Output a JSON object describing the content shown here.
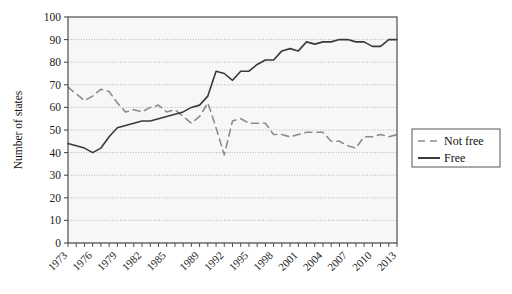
{
  "chart_data": {
    "type": "line",
    "title": "",
    "xlabel": "",
    "ylabel": "Number of states",
    "ylim": [
      0,
      100
    ],
    "xlim": [
      1973,
      2013
    ],
    "ytick_step": 10,
    "yticks": [
      0,
      10,
      20,
      30,
      40,
      50,
      60,
      70,
      80,
      90,
      100
    ],
    "xticks": [
      1973,
      1976,
      1979,
      1982,
      1985,
      1989,
      1992,
      1995,
      1998,
      2001,
      2004,
      2007,
      2010,
      2013
    ],
    "xtick_labels": [
      "1973",
      "1976",
      "1979",
      "1982",
      "1985",
      "1989",
      "1992",
      "1995",
      "1998",
      "2001",
      "2004",
      "2007",
      "2010",
      "2013"
    ],
    "grid": "horizontal-dotted",
    "legend_position": "right",
    "x": [
      1973,
      1974,
      1975,
      1976,
      1977,
      1978,
      1979,
      1980,
      1981,
      1982,
      1983,
      1984,
      1985,
      1986,
      1987,
      1988,
      1989,
      1990,
      1991,
      1992,
      1993,
      1994,
      1995,
      1996,
      1997,
      1998,
      1999,
      2000,
      2001,
      2002,
      2003,
      2004,
      2005,
      2006,
      2007,
      2008,
      2009,
      2010,
      2011,
      2012,
      2013
    ],
    "series": [
      {
        "name": "Not free",
        "style": "dashed",
        "color": "#8c8c8c",
        "values": [
          69,
          66,
          63,
          65,
          68,
          67,
          62,
          58,
          59,
          58,
          60,
          61,
          58,
          59,
          56,
          53,
          56,
          62,
          51,
          39,
          54,
          55,
          53,
          53,
          53,
          48,
          48,
          47,
          48,
          49,
          49,
          49,
          45,
          45,
          43,
          42,
          47,
          47,
          48,
          47,
          48
        ],
        "dash_pattern": "7,5",
        "line_width": 1.6
      },
      {
        "name": "Free",
        "style": "solid",
        "color": "#3a3a3a",
        "values": [
          44,
          43,
          42,
          40,
          42,
          47,
          51,
          52,
          53,
          54,
          54,
          55,
          56,
          57,
          58,
          60,
          61,
          65,
          76,
          75,
          72,
          76,
          76,
          79,
          81,
          81,
          85,
          86,
          85,
          89,
          88,
          89,
          89,
          90,
          90,
          89,
          89,
          87,
          87,
          90,
          90
        ],
        "line_width": 1.6
      }
    ],
    "legend": [
      {
        "label": "Not free",
        "style": "dashed",
        "color": "#8c8c8c"
      },
      {
        "label": "Free",
        "style": "solid",
        "color": "#3a3a3a"
      }
    ]
  },
  "plot_style": {
    "plot_bg": "#f7f7f7",
    "axis_color": "#4d4d4d",
    "grid_color": "#aaaaaa",
    "text_color": "#111111",
    "legend_border": "#555555"
  }
}
